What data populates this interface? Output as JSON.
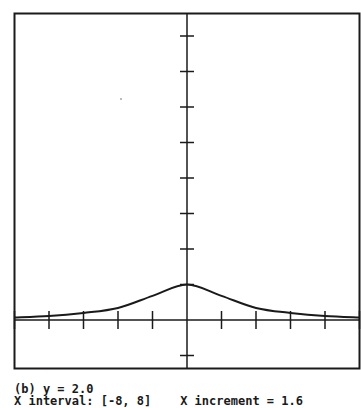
{
  "caption": {
    "label": "(b) y = 2.0",
    "interval_line": "X interval: [-8, 8]    X increment = 1.6"
  },
  "colors": {
    "line": "#1a1a1a",
    "background": "#ffffff"
  },
  "chart_data": {
    "type": "line",
    "title": "(b) y = 2.0",
    "xlabel": "",
    "ylabel": "",
    "xlim": [
      -8,
      8
    ],
    "ylim": [
      -1.4,
      8.7
    ],
    "x_tick_step": 1.6,
    "y_tick_step": 1,
    "grid": false,
    "legend": null,
    "annotations": [
      "X interval: [-8, 8]",
      "X increment = 1.6"
    ],
    "x": [
      -8,
      -6.4,
      -4.8,
      -3.2,
      -1.6,
      0,
      1.6,
      3.2,
      4.8,
      6.4,
      8
    ],
    "series": [
      {
        "name": "y = 2.0",
        "values": [
          0.07,
          0.11,
          0.2,
          0.34,
          0.68,
          1.0,
          0.68,
          0.34,
          0.2,
          0.11,
          0.07
        ]
      }
    ]
  }
}
